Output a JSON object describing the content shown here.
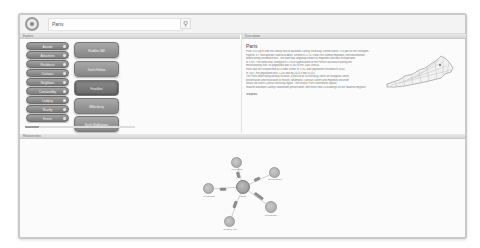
{
  "header": {
    "search_value": "Paris",
    "search_icon": "search-icon",
    "logo_icon": "globe-logo-icon"
  },
  "left_panel": {
    "header": "Explore",
    "categories": [
      {
        "label": "Awards"
      },
      {
        "label": "Attractions"
      },
      {
        "label": "Residence"
      },
      {
        "label": "Contains"
      },
      {
        "label": "Neighbors"
      },
      {
        "label": "Containedby"
      },
      {
        "label": "Lodging"
      },
      {
        "label": "Nearby"
      },
      {
        "label": "Events"
      },
      {
        "label": "Notable"
      }
    ],
    "results": [
      {
        "label": "Ruddles Mill",
        "selected": false
      },
      {
        "label": "Dutch Hollow",
        "selected": false
      },
      {
        "label": "Frankfort",
        "selected": true
      },
      {
        "label": "Millersburg",
        "selected": false
      },
      {
        "label": "North Middletown",
        "selected": false
      }
    ]
  },
  "right_panel": {
    "header": "Description",
    "title": "Paris",
    "description_lines": [
      "Paris is a city in and the county seat of Bourbon County, Kentucky, United States. It is part of the Lexington-",
      "Fayette, KY Metropolitan Statistical Area. Settled in 1776, it was first named Hopewell, then Bourbonton,",
      "before being renamed Paris. The town was originally known as Hopewell and was incorporated",
      "in 1789. The name was changed in 1790 in appreciation of the French assistance during the",
      "Revolutionary War. Its population was 9,183 at the 2000 census.",
      "Paris was first established as a trade center in 1792, with population recorded in 1810.",
      "In 1847, the population was 1,200 and by 2010 it was 8,553.",
      "The Paris-Millersburg Military Institute, a precursor to Kentucky, offers an inaugural center,",
      "preservation and restoration of historic landmarks. Duncan Tavern and Hopewell Museum",
      "attract the North Central Kentucky region. The historic Paris courthouse square",
      "features Bourbon County's downtown preservation, with more than 20 buildings on the National Register."
    ],
    "footer_link": "Wikipedia",
    "map_icon": "kentucky-counties-map"
  },
  "bottom_panel": {
    "header": "Relationships",
    "graph": {
      "center": "Paris",
      "nodes": [
        {
          "label": "Lexington"
        },
        {
          "label": "Georgetown"
        },
        {
          "label": "Cynthiana"
        },
        {
          "label": "Winchester"
        },
        {
          "label": "Ruddles Mill"
        }
      ]
    }
  }
}
